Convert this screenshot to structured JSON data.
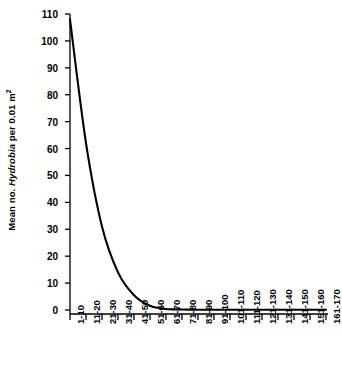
{
  "chart_data": {
    "type": "line",
    "title": "",
    "xlabel": "",
    "ylabel_parts": {
      "prefix": "Mean no. ",
      "species": "Hydrobia",
      "suffix": " per 0.01 m",
      "sup": "2"
    },
    "ylabel": "Mean no. Hydrobia per 0.01 m2",
    "categories": [
      "1-10",
      "11-20",
      "21-30",
      "31-40",
      "41-50",
      "51-60",
      "61-70",
      "71-80",
      "81-90",
      "91-100",
      "101-110",
      "111-120",
      "121-130",
      "131-140",
      "141-150",
      "151-160",
      "161-170"
    ],
    "values": [
      108,
      62,
      31,
      14,
      5.5,
      1.6,
      0.4,
      0.2,
      0.1,
      0.1,
      0.1,
      0.1,
      0.1,
      0.1,
      0.1,
      0.1,
      0.1
    ],
    "yticks": [
      0,
      10,
      20,
      30,
      40,
      50,
      60,
      70,
      80,
      90,
      100,
      110
    ],
    "ylim": [
      0,
      110
    ],
    "grid": false,
    "legend": "none",
    "line_color": "#000000",
    "axis_color": "#000000"
  }
}
